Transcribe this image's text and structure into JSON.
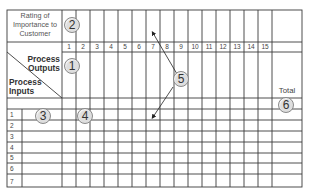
{
  "diagram": {
    "type": "matrix-form",
    "header": {
      "rating_label": [
        "Rating of",
        "Importance to",
        "Customer"
      ],
      "process_outputs_label": [
        "Process",
        "Outputs"
      ],
      "process_inputs_label": [
        "Process",
        "Inputs"
      ],
      "total_label": "Total"
    },
    "columns": [
      "1",
      "2",
      "3",
      "4",
      "5",
      "6",
      "7",
      "8",
      "9",
      "10",
      "11",
      "12",
      "13",
      "14",
      "15"
    ],
    "rows": [
      "1",
      "2",
      "3",
      "4",
      "5",
      "6",
      "7"
    ],
    "callouts": [
      {
        "id": "1",
        "label": "1",
        "meaning": "process outputs"
      },
      {
        "id": "2",
        "label": "2",
        "meaning": "rating of importance to customer"
      },
      {
        "id": "3",
        "label": "3",
        "meaning": "process inputs"
      },
      {
        "id": "4",
        "label": "4",
        "meaning": "matrix cells"
      },
      {
        "id": "5",
        "label": "5",
        "meaning": "arrows pointing to output columns and input rows"
      },
      {
        "id": "6",
        "label": "6",
        "meaning": "total"
      }
    ],
    "colors": {
      "grid_line": "#3a3a3a",
      "callout_fill": "#dedede",
      "callout_border": "#8a8a8a",
      "text": "#333333"
    }
  }
}
